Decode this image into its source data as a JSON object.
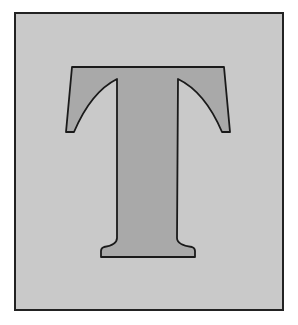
{
  "illustration": {
    "letter": "T",
    "colors": {
      "page_background": "#ffffff",
      "frame_background": "#c9c9c9",
      "frame_border": "#222222",
      "letter_fill": "#a9a9a9",
      "letter_outline": "#1a1a1a"
    }
  }
}
